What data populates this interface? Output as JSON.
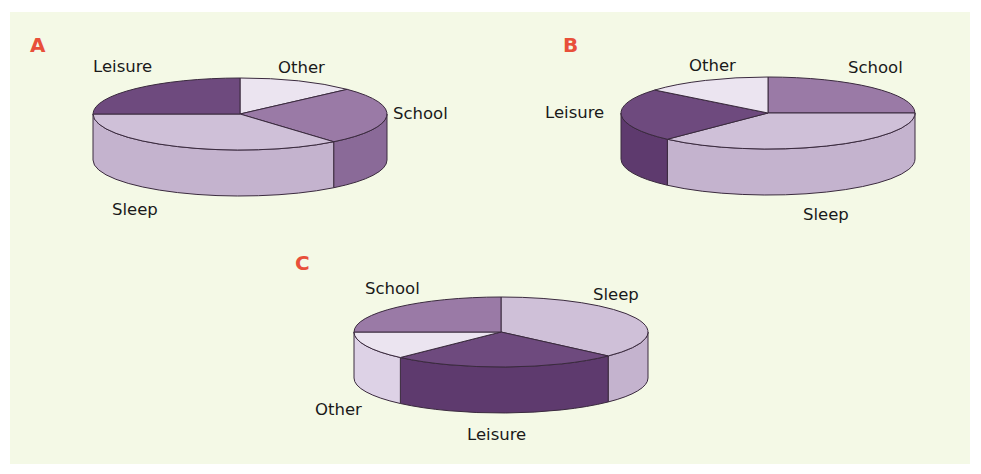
{
  "figure": {
    "panel_background": "#f4f9e6",
    "letter_color": "#e8503a",
    "outline_color": "#3a2a3e"
  },
  "colors": {
    "Leisure": {
      "top": "#6e4a7e",
      "side": "#5e3a6e"
    },
    "School": {
      "top": "#9a7aa6",
      "side": "#8a6a98"
    },
    "Sleep": {
      "top": "#cfc0d8",
      "side": "#c4b3ce"
    },
    "Other": {
      "top": "#ebe4f0",
      "side": "#ddd2e6"
    }
  },
  "chart_data": [
    {
      "type": "pie",
      "title": "A",
      "style": "3d",
      "categories": [
        "Other",
        "School",
        "Sleep",
        "Leisure"
      ],
      "values": [
        13,
        26,
        36,
        25
      ],
      "start_angle_deg": 0,
      "direction": "clockwise",
      "geometry": {
        "cx": 240,
        "cy": 114,
        "rx": 147,
        "ry": 36,
        "depth": 46
      },
      "letter_pos": [
        30,
        52
      ],
      "labels": [
        {
          "text": "Other",
          "x": 278,
          "y": 73
        },
        {
          "text": "School",
          "x": 393,
          "y": 119
        },
        {
          "text": "Sleep",
          "x": 112,
          "y": 215
        },
        {
          "text": "Leisure",
          "x": 93,
          "y": 72
        }
      ]
    },
    {
      "type": "pie",
      "title": "B",
      "style": "3d",
      "categories": [
        "School",
        "Sleep",
        "Leisure",
        "Other"
      ],
      "values": [
        25,
        37,
        24,
        14
      ],
      "start_angle_deg": 0,
      "direction": "clockwise",
      "geometry": {
        "cx": 768,
        "cy": 113,
        "rx": 147,
        "ry": 36,
        "depth": 46
      },
      "letter_pos": [
        563,
        52
      ],
      "labels": [
        {
          "text": "School",
          "x": 848,
          "y": 73
        },
        {
          "text": "Sleep",
          "x": 803,
          "y": 220
        },
        {
          "text": "Leisure",
          "x": 545,
          "y": 118
        },
        {
          "text": "Other",
          "x": 689,
          "y": 71
        }
      ]
    },
    {
      "type": "pie",
      "title": "C",
      "style": "3d",
      "categories": [
        "Sleep",
        "Leisure",
        "Other",
        "School"
      ],
      "values": [
        37,
        25,
        13,
        25
      ],
      "start_angle_deg": 0,
      "direction": "clockwise",
      "geometry": {
        "cx": 501,
        "cy": 332,
        "rx": 147,
        "ry": 35,
        "depth": 46
      },
      "letter_pos": [
        295,
        270
      ],
      "labels": [
        {
          "text": "Sleep",
          "x": 593,
          "y": 300
        },
        {
          "text": "Leisure",
          "x": 467,
          "y": 440
        },
        {
          "text": "Other",
          "x": 315,
          "y": 415
        },
        {
          "text": "School",
          "x": 365,
          "y": 294
        }
      ]
    }
  ]
}
